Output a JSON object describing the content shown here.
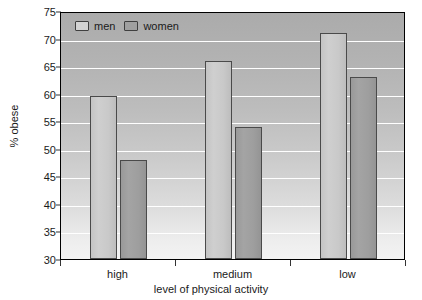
{
  "chart_data": {
    "type": "bar",
    "title": "",
    "categories": [
      "high",
      "medium",
      "low"
    ],
    "series": [
      {
        "name": "men",
        "values": [
          59.5,
          66,
          71
        ],
        "color": "#cccccc"
      },
      {
        "name": "women",
        "values": [
          48,
          54,
          63
        ],
        "color": "#9e9e9e"
      }
    ],
    "xlabel": "level of physical activity",
    "ylabel": "% obese",
    "ylim": [
      30,
      75
    ],
    "ytick_step": 5,
    "yticks": [
      30,
      35,
      40,
      45,
      50,
      55,
      60,
      65,
      70,
      75
    ],
    "ytick_labels": [
      "30",
      "35",
      "40",
      "45",
      "50",
      "55",
      "60",
      "65",
      "70",
      "75"
    ],
    "grid": true,
    "grid_axis": "y",
    "grid_color": "#ffffff",
    "legend": {
      "position": "upper left inside",
      "entries": [
        "men",
        "women"
      ]
    },
    "frame_color": "#000000",
    "plot_background": "light gray vertical gradient"
  },
  "axes": {
    "y_title": "% obese",
    "x_title": "level of physical activity"
  },
  "legend": {
    "men_label": "men",
    "women_label": "women"
  }
}
